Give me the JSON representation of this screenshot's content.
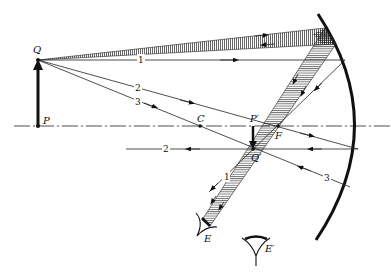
{
  "figure": {
    "labels": {
      "object_top": "Q",
      "object_base": "P",
      "center": "C",
      "focus": "F",
      "image_base": "P′",
      "image_top": "Q′",
      "eye_1": "E",
      "eye_2": "E′"
    },
    "ray_numbers": {
      "ray1_incident": "1",
      "ray2_incident": "2",
      "ray3_incident": "3",
      "ray1_reflected": "1",
      "ray2_reflected": "2",
      "ray3_reflected": "3"
    },
    "colors": {
      "ink": "#222222",
      "background": "#ffffff"
    }
  }
}
